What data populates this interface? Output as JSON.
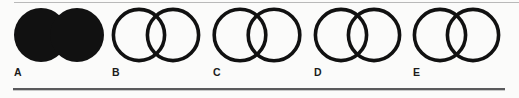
{
  "figure": {
    "kind": "multiple-choice-answer-row",
    "background_color": "#fbfbfa",
    "ink_color": "#111111",
    "top_rule_color": "#b9b9b9",
    "bottom_rule_color": "#5a5a5c",
    "shape_name": "two-overlapping-circles",
    "option_count": 5
  },
  "options": [
    {
      "label": "A",
      "shape": "two-overlapping-circles",
      "fill": "solid-black",
      "fill_color": "#111111",
      "stroke_color": "#111111",
      "stroke_width": 0,
      "selected": true,
      "icon_name": "two-overlapping-circles-filled-icon"
    },
    {
      "label": "B",
      "shape": "two-overlapping-circles",
      "fill": "none",
      "fill_color": "none",
      "stroke_color": "#111111",
      "stroke_width": 3.6,
      "selected": false,
      "icon_name": "two-overlapping-circles-outline-icon"
    },
    {
      "label": "C",
      "shape": "two-overlapping-circles",
      "fill": "none",
      "fill_color": "none",
      "stroke_color": "#111111",
      "stroke_width": 3.6,
      "selected": false,
      "icon_name": "two-overlapping-circles-outline-icon"
    },
    {
      "label": "D",
      "shape": "two-overlapping-circles",
      "fill": "none",
      "fill_color": "none",
      "stroke_color": "#111111",
      "stroke_width": 3.6,
      "selected": false,
      "icon_name": "two-overlapping-circles-outline-icon"
    },
    {
      "label": "E",
      "shape": "two-overlapping-circles",
      "fill": "none",
      "fill_color": "none",
      "stroke_color": "#111111",
      "stroke_width": 3.6,
      "selected": false,
      "icon_name": "two-overlapping-circles-outline-icon"
    }
  ]
}
